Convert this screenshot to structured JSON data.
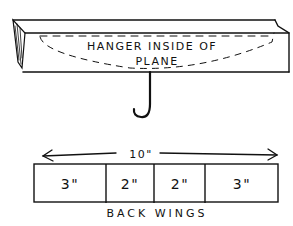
{
  "diagram": {
    "beam": {
      "label_line1": "HANGER INSIDE OF",
      "label_line2": "PLANE"
    },
    "hook": {
      "icon": "hook-icon"
    },
    "dimension": {
      "label": "10\"",
      "arrow": "double-headed-arrow"
    },
    "back_wings": {
      "sections": [
        {
          "label": "3\""
        },
        {
          "label": "2\""
        },
        {
          "label": "2\""
        },
        {
          "label": "3\""
        }
      ],
      "caption": "BACK WINGS"
    },
    "colors": {
      "ink": "#111111",
      "paper": "#ffffff"
    }
  }
}
